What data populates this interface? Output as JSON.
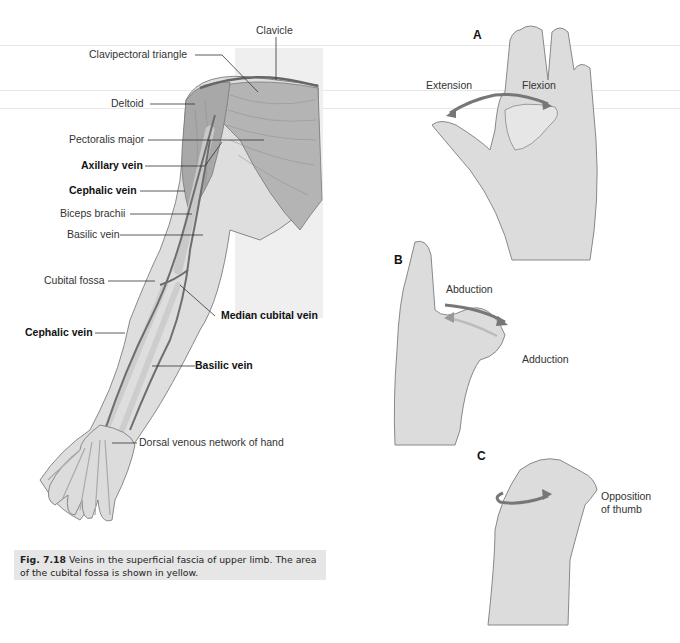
{
  "figure": {
    "number": "Fig. 7.18",
    "caption": "Veins in the superficial fascia of upper limb. The area of the cubital fossa is shown in yellow."
  },
  "arm_labels": {
    "clavicle": "Clavicle",
    "clavipectoral_triangle": "Clavipectoral triangle",
    "deltoid": "Deltoid",
    "pectoralis_major": "Pectoralis major",
    "axillary_vein": "Axillary vein",
    "cephalic_vein_upper": "Cephalic vein",
    "biceps_brachii": "Biceps brachii",
    "basilic_vein_upper": "Basilic vein",
    "cubital_fossa": "Cubital fossa",
    "median_cubital_vein": "Median cubital vein",
    "cephalic_vein_lower": "Cephalic vein",
    "basilic_vein_lower": "Basilic vein",
    "dorsal_venous_network": "Dorsal venous network of hand"
  },
  "thumb_panels": {
    "a": {
      "letter": "A",
      "extension": "Extension",
      "flexion": "Flexion"
    },
    "b": {
      "letter": "B",
      "abduction": "Abduction",
      "adduction": "Adduction"
    },
    "c": {
      "letter": "C",
      "opposition_line1": "Opposition",
      "opposition_line2": "of thumb"
    }
  },
  "colors": {
    "muscle": "#a9a9a9",
    "skin": "#e2e2e2",
    "vein": "#6e6e6e",
    "arrow": "#7a7a7a",
    "caption_bg": "#e6e6e6"
  }
}
